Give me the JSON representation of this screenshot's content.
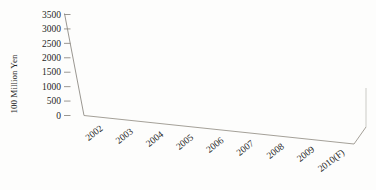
{
  "figure": {
    "background": "#fdfdfc"
  },
  "chart_data": {
    "type": "bar",
    "style": "3d-cylinder-perspective",
    "title": "",
    "xlabel": "",
    "ylabel": "100 Million Yen",
    "categories": [
      "2002",
      "2003",
      "2004",
      "2005",
      "2006",
      "2007",
      "2008",
      "2009",
      "2010(F)"
    ],
    "values": [
      700,
      1000,
      600,
      1000,
      1350,
      1750,
      2100,
      2300,
      2600
    ],
    "ylim": [
      0,
      3500
    ],
    "ytick_step": 500,
    "ytick_labels": [
      "0",
      "500",
      "1000",
      "1500",
      "2000",
      "2500",
      "3000",
      "3500"
    ],
    "grid": false,
    "legend": null,
    "colors": {
      "bar_side": "#3f3f3f",
      "bar_side_light": "#4b4b4b",
      "bar_side_dark": "#323232",
      "bar_top": "#4d4d4d",
      "bar_top_rim": "#5f5f5f",
      "axis_line": "#8f8b84",
      "floor_line": "#9a958c",
      "text": "#1f1f1f"
    }
  }
}
